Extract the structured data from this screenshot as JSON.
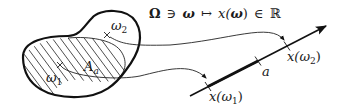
{
  "diagram": {
    "formula": {
      "Omega": "Ω",
      "ni": "∋",
      "omega": "ω",
      "mapsto": "↦",
      "x": "x(",
      "omega2": "ω",
      "close": ")",
      "in": "∈",
      "R": "ℝ"
    },
    "region": {
      "label_A": "A",
      "label_A_sub": "a",
      "point1": {
        "label": "ω",
        "sub": "1"
      },
      "point2": {
        "label": "ω",
        "sub": "2"
      }
    },
    "axis": {
      "tick_a": "a",
      "tick_x1": {
        "prefix": "x(",
        "omega": "ω",
        "sub": "1",
        "suffix": ")"
      },
      "tick_x2": {
        "prefix": "x(",
        "omega": "ω",
        "sub": "2",
        "suffix": ")"
      }
    },
    "colors": {
      "stroke": "#111111",
      "background": "#ffffff"
    }
  }
}
